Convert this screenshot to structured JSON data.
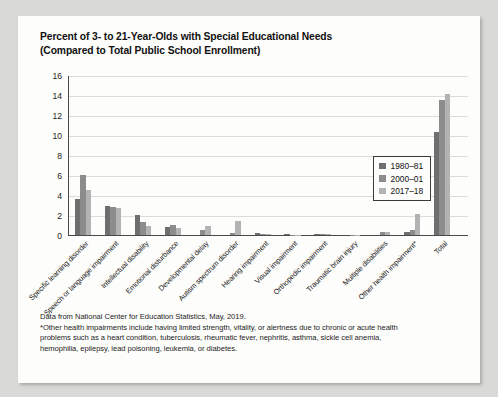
{
  "title": {
    "line1": "Percent of 3- to 21-Year-Olds with Special Educational Needs",
    "line2": "(Compared to Total Public School Enrollment)"
  },
  "legend": {
    "items": [
      {
        "label": "1980–81",
        "color": "#6e6e6e"
      },
      {
        "label": "2000–01",
        "color": "#8c8c8c"
      },
      {
        "label": "2017–18",
        "color": "#b3b3b3"
      }
    ]
  },
  "footnote": {
    "line1": "Data from National Center for Education Statistics, May, 2019.",
    "line2": "*Other health impairments include having limited strength, vitality, or alertness due to chronic or acute health",
    "line3": "problems such as a heart condition, tuberculosis, rheumatic fever, nephritis, asthma, sickle cell anemia,",
    "line4": "hemophilia, epilepsy, lead poisoning, leukemia, or diabetes."
  },
  "chart_data": {
    "type": "bar",
    "title": "Percent of 3- to 21-Year-Olds with Special Educational Needs (Compared to Total Public School Enrollment)",
    "xlabel": "",
    "ylabel": "",
    "ylim": [
      0,
      16
    ],
    "yticks": [
      0,
      2,
      4,
      6,
      8,
      10,
      12,
      14,
      16
    ],
    "grid": true,
    "legend_position": "top-right",
    "categories": [
      "Specific learning disorder",
      "Speech or language impairment",
      "Intellectual disability",
      "Emotional disturbance",
      "Developmental delay",
      "Autism spectrum disorder",
      "Hearing impairment",
      "Visual impairment",
      "Orthopedic impairment",
      "Traumatic brain injury",
      "Multiple disabilities",
      "Other health impairment*",
      "Total"
    ],
    "series": [
      {
        "name": "1980–81",
        "color": "#6e6e6e",
        "values": [
          3.6,
          2.9,
          2.0,
          0.8,
          0,
          0,
          0.2,
          0.1,
          0.1,
          0,
          0,
          0.3,
          10.3
        ]
      },
      {
        "name": "2000–01",
        "color": "#8c8c8c",
        "values": [
          6.0,
          2.8,
          1.3,
          1.0,
          0.5,
          0.2,
          0.15,
          0.05,
          0.15,
          0.05,
          0.3,
          0.5,
          13.5
        ]
      },
      {
        "name": "2017–18",
        "color": "#b3b3b3",
        "values": [
          4.5,
          2.7,
          0.9,
          0.7,
          0.9,
          1.4,
          0.15,
          0.05,
          0.1,
          0.05,
          0.3,
          2.1,
          14.1
        ]
      }
    ]
  }
}
